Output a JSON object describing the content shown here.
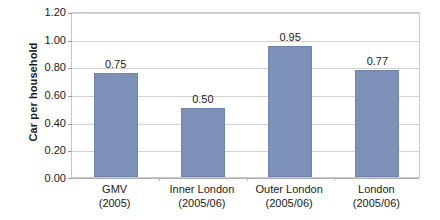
{
  "chart_data": {
    "type": "bar",
    "title": "",
    "subtitle": "",
    "xlabel": "",
    "ylabel": "Car per household",
    "ylim": [
      0.0,
      1.2
    ],
    "ytick_step": 0.2,
    "ytick_labels": [
      "0.00",
      "0.20",
      "0.40",
      "0.60",
      "0.80",
      "1.00",
      "1.20"
    ],
    "ytick_values": [
      0.0,
      0.2,
      0.4,
      0.6,
      0.8,
      1.0,
      1.2
    ],
    "grid": true,
    "legend": false,
    "legend_position": "none",
    "categories": [
      "GMV\n(2005)",
      "Inner London\n(2005/06)",
      "Outer London\n(2005/06)",
      "London\n(2005/06)"
    ],
    "category_lines": [
      [
        "GMV",
        "(2005)"
      ],
      [
        "Inner London",
        "(2005/06)"
      ],
      [
        "Outer London",
        "(2005/06)"
      ],
      [
        "London",
        "(2005/06)"
      ]
    ],
    "values": [
      0.75,
      0.5,
      0.95,
      0.77
    ],
    "data_labels": [
      "0.75",
      "0.50",
      "0.95",
      "0.77"
    ],
    "bar_color": "#7d90b8",
    "bar_border_color": "#7083ac",
    "gridline_color": "#d2d2d2",
    "plot_border_color": "#c8c8c8",
    "text_color": "#1a1a1a",
    "background_color": "#ffffff"
  }
}
